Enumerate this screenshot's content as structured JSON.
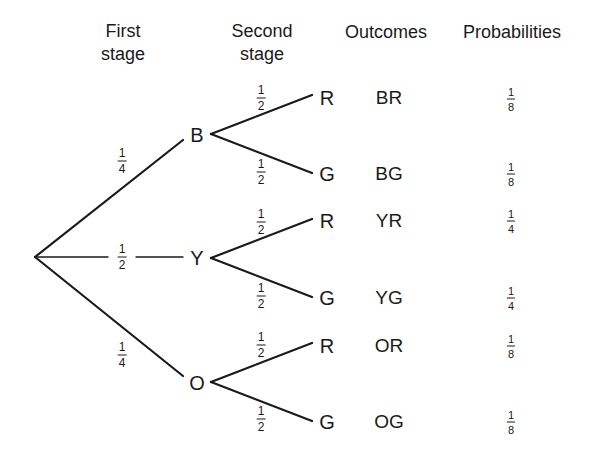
{
  "headers": {
    "first_stage": "First\nstage",
    "second_stage": "Second\nstage",
    "outcomes": "Outcomes",
    "probabilities": "Probabilities"
  },
  "first_stage": [
    {
      "label": "B",
      "prob": {
        "num": "1",
        "den": "4"
      }
    },
    {
      "label": "Y",
      "prob": {
        "num": "1",
        "den": "2"
      }
    },
    {
      "label": "O",
      "prob": {
        "num": "1",
        "den": "4"
      }
    }
  ],
  "second_stage": [
    {
      "label": "R",
      "prob": {
        "num": "1",
        "den": "2"
      },
      "outcome": "BR",
      "probability": {
        "num": "1",
        "den": "8"
      }
    },
    {
      "label": "G",
      "prob": {
        "num": "1",
        "den": "2"
      },
      "outcome": "BG",
      "probability": {
        "num": "1",
        "den": "8"
      }
    },
    {
      "label": "R",
      "prob": {
        "num": "1",
        "den": "2"
      },
      "outcome": "YR",
      "probability": {
        "num": "1",
        "den": "4"
      }
    },
    {
      "label": "G",
      "prob": {
        "num": "1",
        "den": "2"
      },
      "outcome": "YG",
      "probability": {
        "num": "1",
        "den": "4"
      }
    },
    {
      "label": "R",
      "prob": {
        "num": "1",
        "den": "2"
      },
      "outcome": "OR",
      "probability": {
        "num": "1",
        "den": "8"
      }
    },
    {
      "label": "G",
      "prob": {
        "num": "1",
        "den": "2"
      },
      "outcome": "OG",
      "probability": {
        "num": "1",
        "den": "8"
      }
    }
  ]
}
